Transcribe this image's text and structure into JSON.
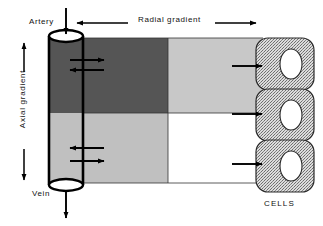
{
  "figure": {
    "background_color": "#ffffff",
    "width": 323,
    "height": 226
  },
  "labels": {
    "artery": "Artery",
    "vein": "Vein",
    "radial_gradient": "Radial gradient",
    "axial_gradient": "Axial gradient",
    "cells": "CELLS"
  },
  "colors": {
    "dark_gray": "#555555",
    "mid_gray": "#c0c0c0",
    "light_gray": "#c8c8c8",
    "white": "#ffffff",
    "outline": "#000000",
    "cell_stipple_fg": "#7a7a7a",
    "cell_stipple_bg": "#dcdcdc",
    "nucleus": "#ffffff"
  },
  "vessel": {
    "name": "blood-vessel-cylinder",
    "top_label": "Artery",
    "bottom_label": "Vein",
    "upper_segment_color": "#555555",
    "lower_segment_color": "#c0c0c0",
    "flow_in_direction": "down",
    "flow_out_direction": "down"
  },
  "gradient_grid": {
    "description": "Two-by-two tissue oxygen concentration field",
    "rows": 2,
    "columns": 2,
    "cells": [
      {
        "row": 0,
        "column": 0,
        "color": "#555555",
        "level": "highest"
      },
      {
        "row": 0,
        "column": 1,
        "color": "#c8c8c8",
        "level": "medium"
      },
      {
        "row": 1,
        "column": 0,
        "color": "#c0c0c0",
        "level": "medium"
      },
      {
        "row": 1,
        "column": 1,
        "color": "#ffffff",
        "level": "lowest"
      }
    ]
  },
  "tissue_cells": [
    {
      "index": 0,
      "name": "tissue-cell-top"
    },
    {
      "index": 1,
      "name": "tissue-cell-middle"
    },
    {
      "index": 2,
      "name": "tissue-cell-bottom"
    }
  ],
  "arrows": {
    "inflow": "down-arrow-into-artery",
    "outflow": "down-arrow-out-of-vein",
    "radial_left": "left-arrow",
    "radial_right": "right-arrow",
    "axial_up": "up-arrow",
    "axial_down": "down-arrow",
    "exchange_upper": [
      "right-arrow",
      "left-arrow"
    ],
    "exchange_lower": [
      "left-arrow",
      "right-arrow"
    ],
    "to_cells": [
      "right-arrow",
      "right-arrow",
      "right-arrow"
    ]
  }
}
